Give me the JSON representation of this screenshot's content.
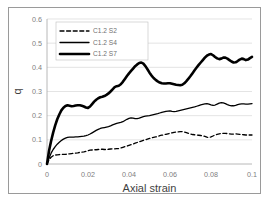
{
  "chart_data": {
    "type": "line",
    "title": "",
    "xlabel": "Axial strain",
    "ylabel": "q",
    "xlim": [
      0,
      0.1
    ],
    "ylim": [
      0,
      0.6
    ],
    "xticks": [
      "0",
      "0.02",
      "0.04",
      "0.06",
      "0.08",
      "0.1"
    ],
    "xtick_values": [
      0,
      0.02,
      0.04,
      0.06,
      0.08,
      0.1
    ],
    "yticks": [
      "0",
      "0.1",
      "0.2",
      "0.3",
      "0.4",
      "0.5",
      "0.6"
    ],
    "ytick_values": [
      0,
      0.1,
      0.2,
      0.3,
      0.4,
      0.5,
      0.6
    ],
    "grid": "horizontal",
    "legend_position": "upper-left-inside",
    "series": [
      {
        "name": "C1.2 S2",
        "style": "dashed",
        "color": "#000000",
        "width": 1.3,
        "x": [
          0.0,
          0.001,
          0.002,
          0.003,
          0.004,
          0.005,
          0.006,
          0.007,
          0.008,
          0.009,
          0.01,
          0.011,
          0.012,
          0.013,
          0.014,
          0.015,
          0.016,
          0.017,
          0.018,
          0.019,
          0.02,
          0.021,
          0.022,
          0.023,
          0.024,
          0.025,
          0.026,
          0.027,
          0.028,
          0.029,
          0.03,
          0.031,
          0.032,
          0.033,
          0.034,
          0.035,
          0.036,
          0.037,
          0.038,
          0.039,
          0.04,
          0.041,
          0.042,
          0.043,
          0.044,
          0.045,
          0.046,
          0.047,
          0.048,
          0.049,
          0.05,
          0.051,
          0.052,
          0.053,
          0.054,
          0.055,
          0.056,
          0.057,
          0.058,
          0.059,
          0.06,
          0.061,
          0.062,
          0.063,
          0.064,
          0.065,
          0.066,
          0.067,
          0.068,
          0.069,
          0.07,
          0.071,
          0.072,
          0.073,
          0.074,
          0.075,
          0.076,
          0.077,
          0.078,
          0.079,
          0.08,
          0.081,
          0.082,
          0.083,
          0.084,
          0.085,
          0.086,
          0.087,
          0.088,
          0.089,
          0.09,
          0.091,
          0.092,
          0.093,
          0.094,
          0.095,
          0.096,
          0.097,
          0.098,
          0.099,
          0.1
        ],
        "y": [
          0.0,
          0.018,
          0.028,
          0.034,
          0.037,
          0.038,
          0.039,
          0.04,
          0.04,
          0.04,
          0.041,
          0.042,
          0.043,
          0.044,
          0.045,
          0.046,
          0.048,
          0.049,
          0.05,
          0.052,
          0.055,
          0.057,
          0.058,
          0.059,
          0.059,
          0.06,
          0.061,
          0.061,
          0.06,
          0.06,
          0.061,
          0.062,
          0.063,
          0.063,
          0.064,
          0.064,
          0.066,
          0.069,
          0.072,
          0.074,
          0.077,
          0.08,
          0.083,
          0.086,
          0.089,
          0.092,
          0.095,
          0.098,
          0.1,
          0.103,
          0.106,
          0.108,
          0.11,
          0.112,
          0.114,
          0.117,
          0.119,
          0.121,
          0.123,
          0.125,
          0.127,
          0.129,
          0.131,
          0.132,
          0.133,
          0.134,
          0.134,
          0.132,
          0.13,
          0.127,
          0.124,
          0.122,
          0.121,
          0.12,
          0.119,
          0.118,
          0.117,
          0.114,
          0.111,
          0.11,
          0.112,
          0.116,
          0.12,
          0.123,
          0.125,
          0.126,
          0.127,
          0.127,
          0.126,
          0.125,
          0.124,
          0.124,
          0.125,
          0.124,
          0.123,
          0.122,
          0.121,
          0.12,
          0.12,
          0.12,
          0.12
        ]
      },
      {
        "name": "C1.2 S4",
        "style": "solid",
        "color": "#000000",
        "width": 1.3,
        "x": [
          0.0,
          0.001,
          0.002,
          0.003,
          0.004,
          0.005,
          0.006,
          0.007,
          0.008,
          0.009,
          0.01,
          0.011,
          0.012,
          0.013,
          0.014,
          0.015,
          0.016,
          0.017,
          0.018,
          0.019,
          0.02,
          0.021,
          0.022,
          0.023,
          0.024,
          0.025,
          0.026,
          0.027,
          0.028,
          0.029,
          0.03,
          0.031,
          0.032,
          0.033,
          0.034,
          0.035,
          0.036,
          0.037,
          0.038,
          0.039,
          0.04,
          0.041,
          0.042,
          0.043,
          0.044,
          0.045,
          0.046,
          0.047,
          0.048,
          0.049,
          0.05,
          0.051,
          0.052,
          0.053,
          0.054,
          0.055,
          0.056,
          0.057,
          0.058,
          0.059,
          0.06,
          0.061,
          0.062,
          0.063,
          0.064,
          0.065,
          0.066,
          0.067,
          0.068,
          0.069,
          0.07,
          0.071,
          0.072,
          0.073,
          0.074,
          0.075,
          0.076,
          0.077,
          0.078,
          0.079,
          0.08,
          0.081,
          0.082,
          0.083,
          0.084,
          0.085,
          0.086,
          0.087,
          0.088,
          0.089,
          0.09,
          0.091,
          0.092,
          0.093,
          0.094,
          0.095,
          0.096,
          0.097,
          0.098,
          0.099,
          0.1
        ],
        "y": [
          0.0,
          0.025,
          0.045,
          0.06,
          0.072,
          0.082,
          0.09,
          0.097,
          0.103,
          0.107,
          0.11,
          0.111,
          0.111,
          0.111,
          0.112,
          0.112,
          0.113,
          0.114,
          0.115,
          0.117,
          0.12,
          0.124,
          0.129,
          0.134,
          0.139,
          0.143,
          0.147,
          0.149,
          0.151,
          0.153,
          0.155,
          0.158,
          0.162,
          0.165,
          0.168,
          0.17,
          0.172,
          0.175,
          0.18,
          0.185,
          0.189,
          0.191,
          0.19,
          0.188,
          0.188,
          0.19,
          0.193,
          0.196,
          0.198,
          0.199,
          0.2,
          0.202,
          0.204,
          0.206,
          0.208,
          0.211,
          0.214,
          0.216,
          0.218,
          0.219,
          0.22,
          0.218,
          0.217,
          0.218,
          0.22,
          0.222,
          0.224,
          0.226,
          0.228,
          0.23,
          0.232,
          0.234,
          0.236,
          0.239,
          0.242,
          0.245,
          0.247,
          0.249,
          0.25,
          0.248,
          0.245,
          0.243,
          0.244,
          0.248,
          0.252,
          0.254,
          0.253,
          0.25,
          0.246,
          0.243,
          0.241,
          0.241,
          0.243,
          0.246,
          0.248,
          0.249,
          0.249,
          0.248,
          0.248,
          0.249,
          0.25
        ]
      },
      {
        "name": "C1.2 S7",
        "style": "solid",
        "color": "#000000",
        "width": 2.6,
        "x": [
          0.0,
          0.001,
          0.002,
          0.003,
          0.004,
          0.005,
          0.006,
          0.007,
          0.008,
          0.009,
          0.01,
          0.011,
          0.012,
          0.013,
          0.014,
          0.015,
          0.016,
          0.017,
          0.018,
          0.019,
          0.02,
          0.021,
          0.022,
          0.023,
          0.024,
          0.025,
          0.026,
          0.027,
          0.028,
          0.029,
          0.03,
          0.031,
          0.032,
          0.033,
          0.034,
          0.035,
          0.036,
          0.037,
          0.038,
          0.039,
          0.04,
          0.041,
          0.042,
          0.043,
          0.044,
          0.045,
          0.046,
          0.047,
          0.048,
          0.049,
          0.05,
          0.051,
          0.052,
          0.053,
          0.054,
          0.055,
          0.056,
          0.057,
          0.058,
          0.059,
          0.06,
          0.061,
          0.062,
          0.063,
          0.064,
          0.065,
          0.066,
          0.067,
          0.068,
          0.069,
          0.07,
          0.071,
          0.072,
          0.073,
          0.074,
          0.075,
          0.076,
          0.077,
          0.078,
          0.079,
          0.08,
          0.081,
          0.082,
          0.083,
          0.084,
          0.085,
          0.086,
          0.087,
          0.088,
          0.089,
          0.09,
          0.091,
          0.092,
          0.093,
          0.094,
          0.095,
          0.096,
          0.097,
          0.098,
          0.099,
          0.1
        ],
        "y": [
          0.0,
          0.055,
          0.095,
          0.13,
          0.16,
          0.185,
          0.205,
          0.222,
          0.233,
          0.24,
          0.243,
          0.241,
          0.239,
          0.24,
          0.242,
          0.243,
          0.243,
          0.241,
          0.238,
          0.234,
          0.232,
          0.238,
          0.248,
          0.258,
          0.266,
          0.272,
          0.276,
          0.278,
          0.281,
          0.286,
          0.292,
          0.3,
          0.309,
          0.318,
          0.322,
          0.324,
          0.33,
          0.34,
          0.352,
          0.364,
          0.375,
          0.385,
          0.395,
          0.405,
          0.412,
          0.418,
          0.42,
          0.415,
          0.405,
          0.392,
          0.378,
          0.366,
          0.356,
          0.348,
          0.342,
          0.337,
          0.334,
          0.333,
          0.333,
          0.334,
          0.334,
          0.332,
          0.33,
          0.328,
          0.327,
          0.326,
          0.328,
          0.334,
          0.343,
          0.353,
          0.364,
          0.376,
          0.388,
          0.399,
          0.41,
          0.42,
          0.43,
          0.44,
          0.448,
          0.453,
          0.455,
          0.45,
          0.443,
          0.437,
          0.434,
          0.436,
          0.44,
          0.44,
          0.436,
          0.43,
          0.424,
          0.42,
          0.421,
          0.426,
          0.432,
          0.436,
          0.434,
          0.43,
          0.432,
          0.438,
          0.443
        ]
      }
    ]
  }
}
